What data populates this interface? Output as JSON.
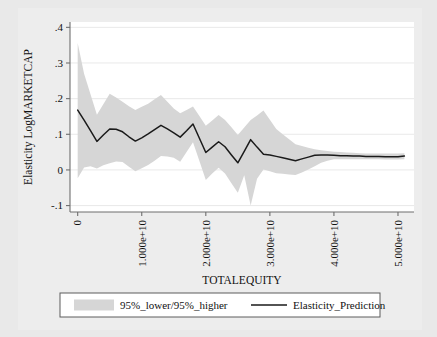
{
  "chart_data": {
    "type": "area",
    "title": "",
    "xlabel": "TOTALEQUITY",
    "ylabel": "Elasticity LogMARKETCAP",
    "xlim": [
      -1200000000.0,
      52500000000.0
    ],
    "ylim": [
      -0.118,
      0.415
    ],
    "grid": true,
    "xticks": [
      0,
      10000000000,
      20000000000,
      30000000000,
      40000000000,
      50000000000
    ],
    "xticklabels": [
      "0",
      "1.000e+10",
      "2.000e+10",
      "3.000e+10",
      "4.000e+10",
      "5.000e+10"
    ],
    "xtick_rotation": 90,
    "yticks": [
      -0.1,
      0,
      0.1,
      0.2,
      0.3,
      0.4
    ],
    "yticklabels": [
      "-.1",
      "0",
      ".1",
      ".2",
      ".3",
      ".4"
    ],
    "legend_position": "below",
    "x": [
      0,
      1000000000,
      2000000000,
      3000000000,
      4000000000,
      5000000000,
      6000000000,
      7000000000,
      8000000000,
      9000000000,
      10000000000,
      11000000000,
      12000000000,
      13000000000,
      14000000000,
      15000000000,
      16000000000,
      17000000000,
      18000000000,
      19000000000,
      20000000000,
      21000000000,
      22000000000,
      23000000000,
      24000000000,
      25000000000,
      26000000000,
      27000000000,
      28000000000,
      29000000000,
      30000000000,
      31000000000,
      32000000000,
      33000000000,
      34000000000,
      35000000000,
      36000000000,
      37000000000,
      38000000000,
      39000000000,
      40000000000,
      41000000000,
      42000000000,
      43000000000,
      44000000000,
      45000000000,
      46000000000,
      47000000000,
      48000000000,
      49000000000,
      50000000000,
      51000000000
    ],
    "series": [
      {
        "name": "Elasticity_Prediction",
        "type": "line",
        "color": "#1a1a1a",
        "values": [
          0.168,
          0.14,
          0.11,
          0.08,
          0.098,
          0.115,
          0.114,
          0.107,
          0.093,
          0.081,
          0.09,
          0.101,
          0.113,
          0.125,
          0.115,
          0.104,
          0.092,
          0.11,
          0.129,
          0.089,
          0.049,
          0.064,
          0.079,
          0.065,
          0.042,
          0.02,
          0.052,
          0.085,
          0.064,
          0.044,
          0.042,
          0.038,
          0.034,
          0.03,
          0.026,
          0.031,
          0.036,
          0.041,
          0.042,
          0.042,
          0.041,
          0.04,
          0.04,
          0.039,
          0.039,
          0.038,
          0.038,
          0.038,
          0.037,
          0.037,
          0.037,
          0.039
        ]
      },
      {
        "name": "95%_higher",
        "type": "band-upper",
        "color": "#d6d6d6",
        "values": [
          0.356,
          0.27,
          0.212,
          0.155,
          0.184,
          0.214,
          0.203,
          0.191,
          0.179,
          0.168,
          0.177,
          0.186,
          0.198,
          0.21,
          0.191,
          0.172,
          0.159,
          0.168,
          0.178,
          0.151,
          0.124,
          0.139,
          0.154,
          0.14,
          0.12,
          0.098,
          0.119,
          0.14,
          0.153,
          0.167,
          0.141,
          0.115,
          0.1,
          0.086,
          0.072,
          0.067,
          0.062,
          0.058,
          0.055,
          0.053,
          0.051,
          0.05,
          0.049,
          0.048,
          0.047,
          0.046,
          0.046,
          0.046,
          0.046,
          0.046,
          0.046,
          0.047
        ]
      },
      {
        "name": "95%_lower",
        "type": "band-lower",
        "color": "#d6d6d6",
        "values": [
          -0.023,
          0.007,
          0.01,
          0.004,
          0.013,
          0.019,
          0.024,
          0.022,
          0.009,
          -0.004,
          0.005,
          0.014,
          0.026,
          0.039,
          0.038,
          0.034,
          0.023,
          0.05,
          0.078,
          0.025,
          -0.028,
          -0.01,
          0.006,
          -0.01,
          -0.037,
          -0.064,
          -0.015,
          -0.1,
          -0.025,
          0.001,
          -0.004,
          -0.009,
          -0.011,
          -0.013,
          -0.014,
          -0.007,
          0.001,
          0.01,
          0.02,
          0.026,
          0.03,
          0.03,
          0.03,
          0.03,
          0.03,
          0.03,
          0.03,
          0.03,
          0.029,
          0.029,
          0.029,
          0.03
        ]
      }
    ],
    "legend": [
      {
        "label": "95%_lower/95%_higher",
        "marker": "swatch",
        "color": "#d6d6d6"
      },
      {
        "label": "Elasticity_Prediction",
        "marker": "line",
        "color": "#1a1a1a"
      }
    ]
  }
}
